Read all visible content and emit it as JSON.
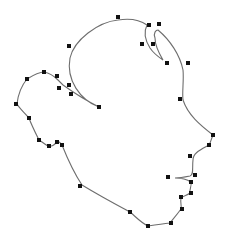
{
  "diagram": {
    "type": "bezier-outline-editor",
    "colors": {
      "background": "#ffffff",
      "outline": "#6e6e6e",
      "handle": "#111111",
      "node": "#333333"
    },
    "outline_path": "M 99 107 C 80 100 66 80 70 58 C 74 40 98 22 118 20 C 130 18 140 20 147 25 C 143 33 145 40 150 48 C 154 54 160 58 163 60 C 160 55 155 45 155 38 C 153 33 156 30 158 30 C 170 40 180 55 183 70 C 184 80 182 92 183 100 C 188 115 200 125 213 135 C 211 140 210 144 209 145 C 200 150 193 153 193 160 C 192 168 194 175 190 176 C 185 177 180 178 175 178 C 182 178 188 180 191 182 C 192 186 189 190 190 193 C 188 195 183 196 181 198 C 180 203 182 207 181 209 C 176 216 172 220 170 223 C 162 224 155 225 148 226 C 140 222 135 216 130 212 C 115 204 100 196 82 185 C 72 170 66 155 62 145 C 60 142 58 141 57 142 C 54 145 52 147 48 146 C 44 144 41 141 39 140 C 34 130 31 124 29 118 C 24 112 19 108 17 104 C 18 95 22 85 27 79 C 35 74 40 72 44 72 C 50 73 55 77 58 80 C 60 82 62 84 63 85 C 70 90 85 100 99 107 Z",
    "anchor_points": [
      {
        "x": 118,
        "y": 17
      },
      {
        "x": 149,
        "y": 25
      },
      {
        "x": 159,
        "y": 24
      },
      {
        "x": 142,
        "y": 44
      },
      {
        "x": 153,
        "y": 44
      },
      {
        "x": 167,
        "y": 63
      },
      {
        "x": 188,
        "y": 63
      },
      {
        "x": 69,
        "y": 46
      },
      {
        "x": 44,
        "y": 72
      },
      {
        "x": 27,
        "y": 79
      },
      {
        "x": 57,
        "y": 76
      },
      {
        "x": 59,
        "y": 88
      },
      {
        "x": 69,
        "y": 85
      },
      {
        "x": 71,
        "y": 94
      },
      {
        "x": 16,
        "y": 104
      },
      {
        "x": 99,
        "y": 107
      },
      {
        "x": 180,
        "y": 99
      },
      {
        "x": 29,
        "y": 118
      },
      {
        "x": 39,
        "y": 140
      },
      {
        "x": 49,
        "y": 146
      },
      {
        "x": 57,
        "y": 142
      },
      {
        "x": 62,
        "y": 145
      },
      {
        "x": 213,
        "y": 135
      },
      {
        "x": 209,
        "y": 145
      },
      {
        "x": 190,
        "y": 156
      },
      {
        "x": 168,
        "y": 177
      },
      {
        "x": 195,
        "y": 175
      },
      {
        "x": 191,
        "y": 182
      },
      {
        "x": 191,
        "y": 193
      },
      {
        "x": 181,
        "y": 197
      },
      {
        "x": 182,
        "y": 209
      },
      {
        "x": 80,
        "y": 186
      },
      {
        "x": 130,
        "y": 212
      },
      {
        "x": 148,
        "y": 226
      },
      {
        "x": 171,
        "y": 223
      }
    ]
  }
}
